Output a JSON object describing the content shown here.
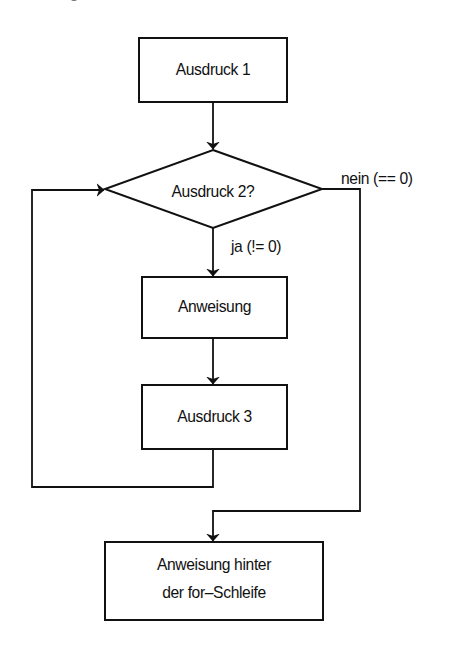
{
  "diagram": {
    "type": "flowchart",
    "colors": {
      "background": "#ffffff",
      "stroke": "#111111",
      "text": "#111111"
    },
    "nodes": {
      "expr1": {
        "shape": "rectangle",
        "label": "Ausdruck 1"
      },
      "expr2": {
        "shape": "diamond",
        "label": "Ausdruck 2?"
      },
      "statement": {
        "shape": "rectangle",
        "label": "Anweisung"
      },
      "expr3": {
        "shape": "rectangle",
        "label": "Ausdruck 3"
      },
      "after": {
        "shape": "rectangle",
        "label_line1": "Anweisung hinter",
        "label_line2": "der for–Schleife"
      }
    },
    "edges": [
      {
        "from": "expr1",
        "to": "expr2",
        "label": ""
      },
      {
        "from": "expr2",
        "to": "statement",
        "label": "ja (!= 0)"
      },
      {
        "from": "statement",
        "to": "expr3",
        "label": ""
      },
      {
        "from": "expr3",
        "to": "expr2",
        "label": ""
      },
      {
        "from": "expr2",
        "to": "after",
        "label": "nein (== 0)"
      }
    ],
    "edge_labels": {
      "yes": "ja (!= 0)",
      "no": "nein (== 0)"
    }
  }
}
